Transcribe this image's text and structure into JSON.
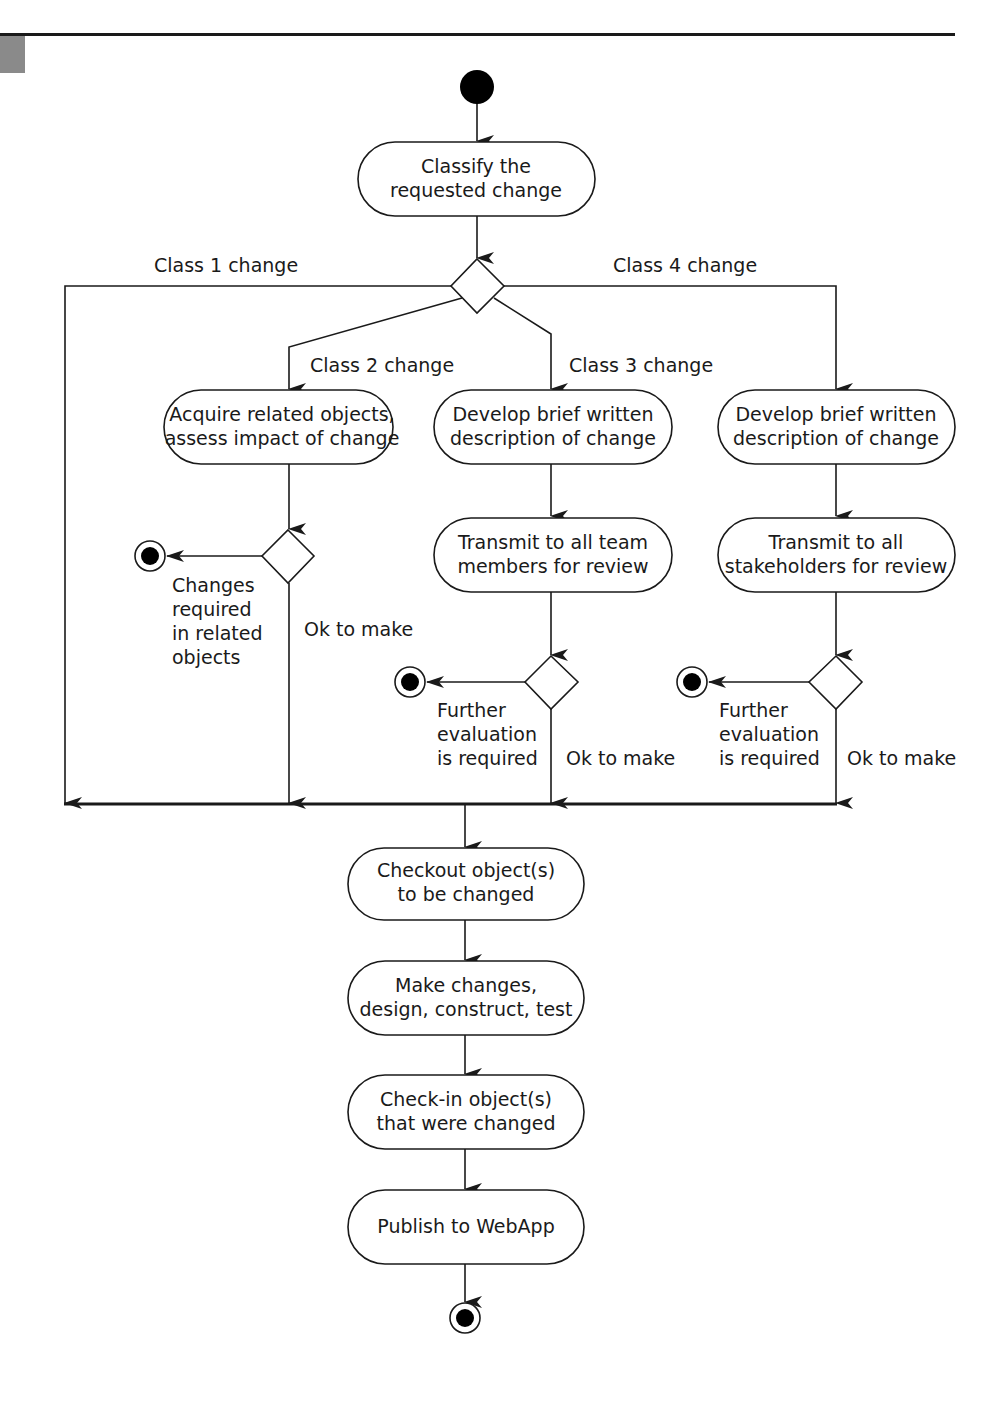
{
  "diagram": {
    "type": "uml-activity",
    "colors": {
      "line": "#1a1a1a",
      "background": "#ffffff",
      "corner_tab": "#8a8a8a"
    },
    "nodes": {
      "classify": [
        "Classify the",
        "requested change"
      ],
      "acquire": [
        "Acquire related objects,",
        "assess impact of change"
      ],
      "develop_c3": [
        "Develop brief written",
        "description of change"
      ],
      "develop_c4": [
        "Develop brief written",
        "description of change"
      ],
      "transmit_team": [
        "Transmit to all team",
        "members for review"
      ],
      "transmit_stake": [
        "Transmit to all",
        "stakeholders for review"
      ],
      "checkout": [
        "Checkout object(s)",
        "to be changed"
      ],
      "make_changes": [
        "Make changes,",
        "design, construct, test"
      ],
      "checkin": [
        "Check-in object(s)",
        "that were changed"
      ],
      "publish": [
        "Publish to WebApp"
      ]
    },
    "branch_labels": {
      "class1": "Class 1 change",
      "class2": "Class 2 change",
      "class3": "Class 3 change",
      "class4": "Class 4 change"
    },
    "guard_labels": {
      "c2_reject": [
        "Changes",
        "required",
        "in related",
        "objects"
      ],
      "c2_ok": "Ok to make",
      "c3_reject": [
        "Further",
        "evaluation",
        "is required"
      ],
      "c3_ok": "Ok to make",
      "c4_reject": [
        "Further",
        "evaluation",
        "is required"
      ],
      "c4_ok": "Ok to make"
    }
  }
}
